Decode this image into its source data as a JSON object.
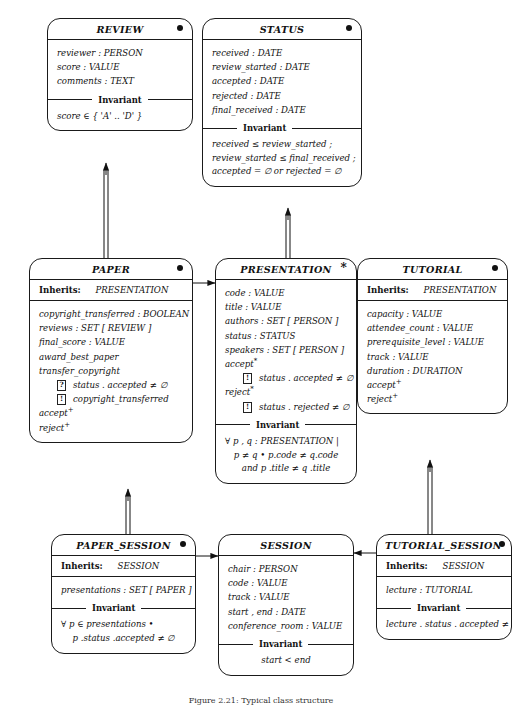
{
  "diagram": {
    "caption": "Figure 2.21: Typical class structure",
    "glyphs": {
      "dot": "●",
      "star": "*",
      "guard_q": "?",
      "guard_b": "!",
      "plus": "+",
      "asterisk": "*"
    },
    "labels": {
      "inherits": "Inherits:",
      "invariant": "Invariant"
    }
  },
  "classes": {
    "review": {
      "name": "REVIEW",
      "marker": "●",
      "attributes": [
        "reviewer : PERSON",
        "score : VALUE",
        "comments : TEXT"
      ],
      "invariant": [
        "score ∈ { 'A' .. 'D' }"
      ]
    },
    "status": {
      "name": "STATUS",
      "marker": "●",
      "attributes": [
        "received : DATE",
        "review_started : DATE",
        "accepted : DATE",
        "rejected : DATE",
        "final_received : DATE"
      ],
      "invariant": [
        "received ≤ review_started ;",
        "review_started ≤ final_received ;",
        "accepted = ∅ or rejected = ∅"
      ]
    },
    "paper": {
      "name": "PAPER",
      "marker": "●",
      "inherits": "PRESENTATION",
      "attributes": [
        "copyright_transferred : BOOLEAN",
        "reviews : SET [ REVIEW ]",
        "final_score : VALUE",
        "award_best_paper",
        "transfer_copyright"
      ],
      "guards": [
        {
          "kind": "?",
          "text": "status . accepted ≠ ∅"
        },
        {
          "kind": "!",
          "text": "copyright_transferred"
        }
      ],
      "operations": [
        {
          "name": "accept",
          "sup": "+"
        },
        {
          "name": "reject",
          "sup": "+"
        }
      ]
    },
    "presentation": {
      "name": "PRESENTATION",
      "marker": "*",
      "attributes": [
        "code : VALUE",
        "title : VALUE",
        "authors : SET [ PERSON ]",
        "status : STATUS",
        "speakers : SET [ PERSON ]"
      ],
      "operations": [
        {
          "name": "accept",
          "sup": "*",
          "guard": {
            "kind": "!",
            "text": "status . accepted ≠ ∅"
          }
        },
        {
          "name": "reject",
          "sup": "*",
          "guard": {
            "kind": "!",
            "text": "status . rejected ≠ ∅"
          }
        }
      ],
      "invariant": [
        "∀ p , q : PRESENTATION  |",
        "p ≠ q • p.code ≠ q.code",
        "and p .title ≠ q .title"
      ]
    },
    "tutorial": {
      "name": "TUTORIAL",
      "marker": "●",
      "inherits": "PRESENTATION",
      "attributes": [
        "capacity : VALUE",
        "attendee_count : VALUE",
        "prerequisite_level : VALUE",
        "track : VALUE",
        "duration : DURATION"
      ],
      "operations": [
        {
          "name": "accept",
          "sup": "+"
        },
        {
          "name": "reject",
          "sup": "+"
        }
      ]
    },
    "paper_session": {
      "name": "PAPER_SESSION",
      "marker": "●",
      "inherits": "SESSION",
      "attributes": [
        "presentations : SET [ PAPER ]"
      ],
      "invariant": [
        "∀ p ∈ presentations •",
        "p .status .accepted ≠ ∅"
      ]
    },
    "session": {
      "name": "SESSION",
      "marker": "",
      "attributes": [
        "chair : PERSON",
        "code : VALUE",
        "track : VALUE",
        "start , end : DATE",
        "conference_room : VALUE"
      ],
      "invariant": [
        "start < end"
      ]
    },
    "tutorial_session": {
      "name": "TUTORIAL_SESSION",
      "marker": "●",
      "inherits": "SESSION",
      "attributes": [
        "lecture : TUTORIAL"
      ],
      "invariant": [
        "lecture . status . accepted ≠ ∅"
      ]
    }
  }
}
